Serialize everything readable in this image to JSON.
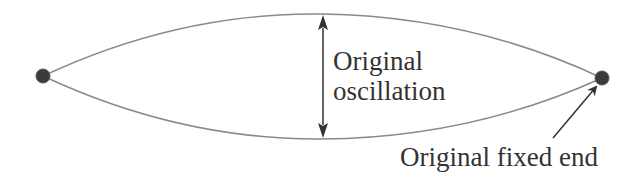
{
  "diagram": {
    "labels": {
      "oscillation_line1": "Original",
      "oscillation_line2": "oscillation",
      "fixed_end": "Original fixed end"
    },
    "colors": {
      "curve": "#8a8a8a",
      "dot": "#3a3a3a",
      "arrow": "#333333",
      "text": "#333333"
    }
  }
}
